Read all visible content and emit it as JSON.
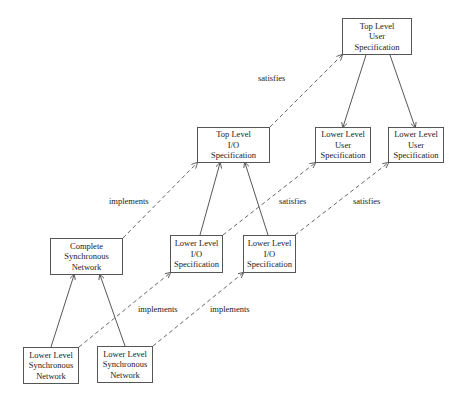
{
  "nodes": {
    "top_user_spec": {
      "lines": [
        "Top Level",
        "User",
        "Specification"
      ]
    },
    "top_io_spec": {
      "lines": [
        "Top Level",
        "I/O",
        "Specification"
      ]
    },
    "lower_user_spec_1": {
      "lines": [
        "Lower Level",
        "User",
        "Specification"
      ]
    },
    "lower_user_spec_2": {
      "lines": [
        "Lower Level",
        "User",
        "Specification"
      ]
    },
    "complete_sync_net": {
      "lines": [
        "Complete",
        "Synchronous",
        "Network"
      ]
    },
    "lower_io_spec_1": {
      "lines": [
        "Lower Level",
        "I/O",
        "Specification"
      ]
    },
    "lower_io_spec_2": {
      "lines": [
        "Lower Level",
        "I/O",
        "Specification"
      ]
    },
    "lower_sync_net_1": {
      "lines": [
        "Lower Level",
        "Synchronous",
        "Network"
      ]
    },
    "lower_sync_net_2": {
      "lines": [
        "Lower Level",
        "Synchronous",
        "Network"
      ]
    }
  },
  "edges": [
    {
      "from": "top_user_spec",
      "to": "lower_user_spec_1",
      "style": "solid"
    },
    {
      "from": "top_user_spec",
      "to": "lower_user_spec_2",
      "style": "solid"
    },
    {
      "from": "lower_io_spec_1",
      "to": "top_io_spec",
      "style": "solid"
    },
    {
      "from": "lower_io_spec_2",
      "to": "top_io_spec",
      "style": "solid"
    },
    {
      "from": "lower_sync_net_1",
      "to": "complete_sync_net",
      "style": "solid"
    },
    {
      "from": "lower_sync_net_2",
      "to": "complete_sync_net",
      "style": "solid"
    },
    {
      "from": "top_io_spec",
      "to": "top_user_spec",
      "style": "dashed",
      "label": "satisfies"
    },
    {
      "from": "complete_sync_net",
      "to": "top_io_spec",
      "style": "dashed",
      "label": "implements"
    },
    {
      "from": "lower_io_spec_1",
      "to": "lower_user_spec_1",
      "style": "dashed",
      "label": "satisfies"
    },
    {
      "from": "lower_io_spec_2",
      "to": "lower_user_spec_2",
      "style": "dashed",
      "label": "satisfies"
    },
    {
      "from": "lower_sync_net_1",
      "to": "lower_io_spec_1",
      "style": "dashed",
      "label": "implements"
    },
    {
      "from": "lower_sync_net_2",
      "to": "lower_io_spec_2",
      "style": "dashed",
      "label": "implements"
    }
  ],
  "labels": {
    "satisfies_top": "satisfies",
    "implements_top": "implements",
    "satisfies_mid_1": "satisfies",
    "satisfies_mid_2": "satisfies",
    "implements_low_1": "implements",
    "implements_low_2": "implements"
  }
}
